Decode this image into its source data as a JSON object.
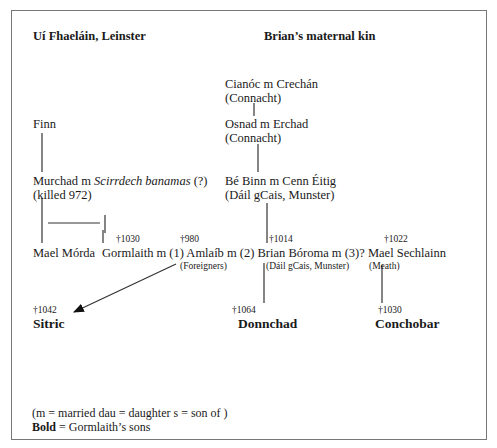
{
  "headers": {
    "left": "Uí Fhaeláin, Leinster",
    "right": "Brian’s maternal kin"
  },
  "maternal": {
    "cianoc": "Cianóc m Crechán",
    "cianoc_region": "(Connacht)",
    "osnad": "Osnad m Erchad",
    "osnad_region": "(Connacht)",
    "bebinn": "Bé Binn m Cenn Éitig",
    "bebinn_region": "(Dáil gCais, Munster)"
  },
  "leinster": {
    "finn": "Finn",
    "murchad": "Murchad  m ",
    "murchad_spouse": "Scirrdech banamas",
    "murchad_q": " (?)",
    "murchad_note": "(killed 972)"
  },
  "generation": {
    "mael_morda": "Mael Mórda",
    "gormlaith": "Gormlaith m (1) Amlaíb  m (2) Brian Bóroma   m (3)? Mael Sechlainn",
    "gormlaith_death": "†1030",
    "amlaib_death": "†980",
    "brian_death": "†1014",
    "mael_sechlainn_death": "†1022",
    "amlaib_region": "(Foreigners)",
    "brian_region": "(Dáil gCais, Munster)",
    "mael_sechlainn_region": "(Meath)"
  },
  "sons": [
    {
      "name": "Sitric",
      "death": "†1042"
    },
    {
      "name": "Donnchad",
      "death": "†1064"
    },
    {
      "name": "Conchobar",
      "death": "†1030"
    }
  ],
  "legend": {
    "abbrev": "(m = married   dau = daughter   s = son of )",
    "bold_label": "Bold",
    "bold_meaning": " = Gormlaith’s sons"
  },
  "colors": {
    "text": "#1a1a1a",
    "lines": "#333333",
    "frame": "#777777"
  }
}
